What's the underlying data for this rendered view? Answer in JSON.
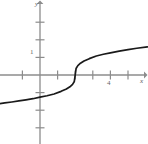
{
  "figure": {
    "name": "cube-root-function-graph",
    "background_color": "#ffffff",
    "width": 148,
    "height": 144
  },
  "axes": {
    "x_axis_label": "x",
    "y_axis_label": "y",
    "axis_color": "#8c8c8c",
    "tick_color": "#8c8c8c",
    "origin_px": {
      "x": 40,
      "y": 75
    },
    "unit_px": 17.6
  },
  "tick_labels": {
    "x": [
      {
        "value": "4",
        "at": 4
      }
    ],
    "y": [
      {
        "value": "1",
        "at": 1
      }
    ]
  },
  "chart_data": {
    "type": "line",
    "title": "",
    "xlabel": "x",
    "ylabel": "y",
    "xlim": [
      -2.3,
      6.1
    ],
    "ylim": [
      -3.9,
      4.3
    ],
    "grid": false,
    "legend": "none",
    "curve_color": "#1a1a1a",
    "series": [
      {
        "name": "y = cbrt(x - 2)",
        "x": [
          -2.3,
          -2.0,
          -1.6,
          -1.2,
          -0.8,
          -0.4,
          0.0,
          0.4,
          0.8,
          1.2,
          1.5,
          1.7,
          1.85,
          1.95,
          2.0,
          2.05,
          2.15,
          2.3,
          2.5,
          2.8,
          3.2,
          3.6,
          4.0,
          4.5,
          5.0,
          5.5,
          6.1
        ],
        "y": [
          -1.626,
          -1.587,
          -1.533,
          -1.475,
          -1.413,
          -1.347,
          -1.26,
          -1.177,
          -1.077,
          -0.928,
          -0.794,
          -0.669,
          -0.531,
          -0.368,
          0.0,
          0.368,
          0.531,
          0.669,
          0.794,
          0.928,
          1.077,
          1.177,
          1.26,
          1.357,
          1.442,
          1.518,
          1.601
        ]
      }
    ],
    "x_ticks": [
      -1,
      1,
      2,
      3,
      4,
      5
    ],
    "y_ticks": [
      -3,
      -2,
      -1,
      1,
      2,
      3
    ],
    "annotations": [
      {
        "text": "inflection / vertical tangent",
        "x": 2,
        "y": 0
      }
    ]
  }
}
